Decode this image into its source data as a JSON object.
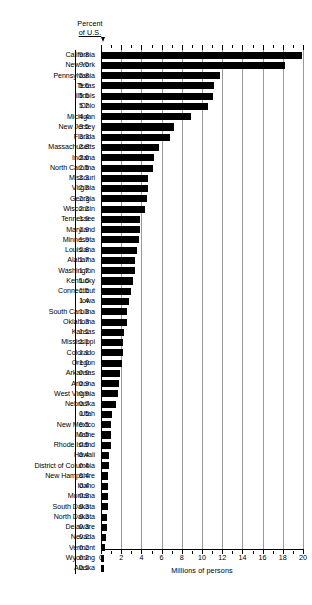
{
  "chart_data": {
    "type": "bar",
    "orientation": "horizontal",
    "title": "",
    "header_label_line1": "Percent",
    "header_label_line2": "of U.S.",
    "xlabel": "Millions of persons",
    "ylabel": "",
    "xlim": [
      0,
      20
    ],
    "xticks": [
      0,
      2,
      4,
      6,
      8,
      10,
      12,
      14,
      16,
      18,
      20
    ],
    "xticklabels": [
      "0",
      "2",
      "4",
      "6",
      "8",
      "10",
      "12",
      "14",
      "16",
      "18",
      "20"
    ],
    "grid": true,
    "legend": null,
    "categories": [
      "California",
      "New York",
      "Pennsylvania",
      "Texas",
      "Illinois",
      "Ohio",
      "Michigan",
      "New Jersey",
      "Florida",
      "Massachusetts",
      "Indiana",
      "North Carolina",
      "Missouri",
      "Virginia",
      "Georgia",
      "Wisconsin",
      "Tennessee",
      "Maryland",
      "Minnesota",
      "Louisiana",
      "Alabama",
      "Washington",
      "Kentucky",
      "Connecticut",
      "Iowa",
      "South Carolina",
      "Oklahoma",
      "Kansas",
      "Mississippi",
      "Colorado",
      "Oregon",
      "Arkansas",
      "Arizona",
      "West Virginia",
      "Nebraska",
      "Utah",
      "New Mexico",
      "Maine",
      "Rhode Island",
      "Hawaii",
      "District of Columbia",
      "New Hampshire",
      "Idaho",
      "Montana",
      "South Dakota",
      "North Dakota",
      "Delaware",
      "Nevada",
      "Vermont",
      "Wyoming",
      "Alaska"
    ],
    "percent_of_us": [
      "9.8",
      "9.0",
      "5.8",
      "5.5",
      "5.5",
      "5.2",
      "4.4",
      "3.5",
      "3.3",
      "2.8",
      "2.6",
      "2.5",
      "2.3",
      "2.3",
      "2.3",
      "2.2",
      "1.9",
      "1.9",
      "1.9",
      "1.8",
      "1.7",
      "1.7",
      "1.6",
      "1.5",
      "1.4",
      "1.3",
      "1.3",
      "1.1",
      "1.1",
      "1.1",
      "1.0",
      "0.9",
      "0.9",
      "0.9",
      "0.7",
      "0.5",
      "0.5",
      "0.5",
      "0.5",
      "0.4",
      "0.4",
      "0.4",
      "0.4",
      "0.3",
      "0.3",
      "0.3",
      "0.3",
      "0.2",
      "0.2",
      "0.2",
      "0.1"
    ],
    "values": [
      19.9,
      18.2,
      11.8,
      11.2,
      11.1,
      10.6,
      8.9,
      7.2,
      6.8,
      5.7,
      5.2,
      5.1,
      4.7,
      4.7,
      4.6,
      4.4,
      3.9,
      3.9,
      3.8,
      3.6,
      3.4,
      3.4,
      3.2,
      3.0,
      2.8,
      2.6,
      2.6,
      2.3,
      2.2,
      2.2,
      2.1,
      1.9,
      1.8,
      1.7,
      1.5,
      1.1,
      1.0,
      1.0,
      0.95,
      0.8,
      0.76,
      0.74,
      0.71,
      0.69,
      0.67,
      0.62,
      0.55,
      0.49,
      0.44,
      0.33,
      0.3
    ]
  },
  "axis": {
    "title": "Millions of persons"
  }
}
